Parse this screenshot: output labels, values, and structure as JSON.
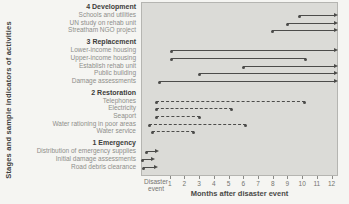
{
  "chart_data": {
    "type": "gantt",
    "ylabel": "Stages and sample indicators of activities",
    "xlabel": "Months after disaster event",
    "x_origin_label": "Disaster event",
    "x_ticks": [
      1,
      2,
      3,
      4,
      5,
      6,
      7,
      8,
      9,
      10,
      11,
      12
    ],
    "x_range_months": [
      -0.95,
      12.3
    ],
    "legend": "solid lines with arrowheads = ongoing activity, dashed lines with end dots = bounded activity",
    "groups": [
      {
        "name": "4 Development",
        "items": [
          {
            "label": "Schools and utilities",
            "start": 9.7,
            "end": 12.2,
            "style": "solid",
            "end_marker": "arrow"
          },
          {
            "label": "UN study on rehab unit",
            "start": 8.9,
            "end": 12.2,
            "style": "solid",
            "end_marker": "arrow"
          },
          {
            "label": "Streatham NGO project",
            "start": 7.9,
            "end": 12.2,
            "style": "solid",
            "end_marker": "arrow"
          }
        ]
      },
      {
        "name": "3 Replacement",
        "items": [
          {
            "label": "Lower-income housing",
            "start": 1.0,
            "end": 12.2,
            "style": "solid",
            "end_marker": "arrow"
          },
          {
            "label": "Upper-income housing",
            "start": 1.0,
            "end": 10.2,
            "style": "solid",
            "end_marker": "dot"
          },
          {
            "label": "Establish rehab unit",
            "start": 5.9,
            "end": 12.2,
            "style": "solid",
            "end_marker": "arrow"
          },
          {
            "label": "Public building",
            "start": 2.9,
            "end": 12.2,
            "style": "solid",
            "end_marker": "arrow"
          },
          {
            "label": "Damage assessments",
            "start": 0.2,
            "end": 12.2,
            "style": "solid",
            "end_marker": "arrow"
          }
        ]
      },
      {
        "name": "2 Restoration",
        "items": [
          {
            "label": "Telephones",
            "start": 0.0,
            "end": 10.1,
            "style": "dashed",
            "end_marker": "dot"
          },
          {
            "label": "Electricity",
            "start": 0.0,
            "end": 5.2,
            "style": "dashed",
            "end_marker": "dot"
          },
          {
            "label": "Seaport",
            "start": 0.0,
            "end": 3.0,
            "style": "dashed",
            "end_marker": "dot"
          },
          {
            "label": "Water rationing in poor areas",
            "start": -0.5,
            "end": 6.1,
            "style": "dashed",
            "end_marker": "dot"
          },
          {
            "label": "Water service",
            "start": -0.3,
            "end": 2.6,
            "style": "dashed",
            "end_marker": "dot"
          }
        ]
      },
      {
        "name": "1 Emergency",
        "items": [
          {
            "label": "Distribution of emergency supplies",
            "start": -0.65,
            "end": 0.05,
            "style": "solid",
            "end_marker": "arrow"
          },
          {
            "label": "Initial damage assessments",
            "start": -0.95,
            "end": -0.2,
            "style": "solid",
            "end_marker": "arrow"
          },
          {
            "label": "Road debris clearance",
            "start": -0.9,
            "end": 0.0,
            "style": "solid",
            "end_marker": "arrow"
          }
        ]
      }
    ],
    "colors": {
      "line": "#4c4c4a",
      "plot_bg": "#dbdbd7",
      "page_bg": "#f5f5f2",
      "header_text": "#3d3d3b",
      "item_text": "#8e8e8a",
      "tick_text": "#747470",
      "plot_border": "#b5b5b1"
    }
  }
}
